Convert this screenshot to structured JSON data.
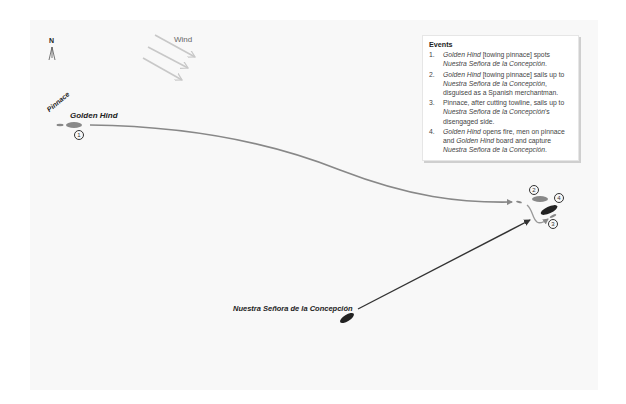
{
  "map": {
    "north_label": "N",
    "wind_label": "Wind",
    "ships": {
      "pinnace_label": "Pinnace",
      "golden_hind_label": "Golden Hind",
      "concepcion_label": "Nuestra Señora de la Concepción"
    },
    "step_markers": [
      "1",
      "2",
      "3",
      "4"
    ],
    "colors": {
      "background": "#f8f8f8",
      "english_ships": "#888888",
      "spanish_ship": "#222222",
      "wind_arrows": "#c8c8c8"
    }
  },
  "legend": {
    "title": "Events",
    "items": [
      {
        "num": "1.",
        "parts": [
          {
            "t": "Golden Hind",
            "i": true
          },
          {
            "t": " [towing pinnace] spots ",
            "i": false
          },
          {
            "t": "Nuestra Señora de la Concepción",
            "i": true
          },
          {
            "t": ".",
            "i": false
          }
        ]
      },
      {
        "num": "2.",
        "parts": [
          {
            "t": "Golden Hind",
            "i": true
          },
          {
            "t": " [towing pinnace] sails up to ",
            "i": false
          },
          {
            "t": "Nuestra Señora de la Concepción",
            "i": true
          },
          {
            "t": ", disguised as a Spanish merchantman.",
            "i": false
          }
        ]
      },
      {
        "num": "3.",
        "parts": [
          {
            "t": "Pinnace, after cutting towline, sails up to ",
            "i": false
          },
          {
            "t": "Nuestra Señora de la Concepción",
            "i": true
          },
          {
            "t": "'s disengaged side.",
            "i": false
          }
        ]
      },
      {
        "num": "4.",
        "parts": [
          {
            "t": "Golden Hind",
            "i": true
          },
          {
            "t": " opens fire, men on  pinnace and ",
            "i": false
          },
          {
            "t": "Golden Hind",
            "i": true
          },
          {
            "t": " board and capture ",
            "i": false
          },
          {
            "t": "Nuestra Señora de la Concepción",
            "i": true
          },
          {
            "t": ".",
            "i": false
          }
        ]
      }
    ]
  }
}
